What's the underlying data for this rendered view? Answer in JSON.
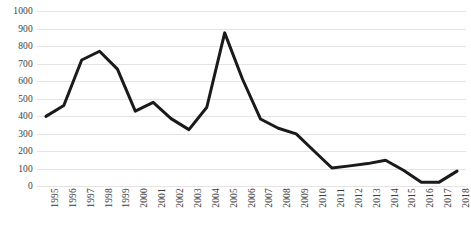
{
  "chart_data": {
    "type": "line",
    "title": "",
    "subtitle": "",
    "xlabel": "",
    "ylabel": "",
    "ylim": [
      0,
      1000
    ],
    "y_ticks": [
      0,
      100,
      200,
      300,
      400,
      500,
      600,
      700,
      800,
      900,
      1000
    ],
    "y_tick_labels": [
      "0",
      "100",
      "200",
      "300",
      "400",
      "500",
      "600",
      "700",
      "800",
      "900",
      "1000"
    ],
    "grid": "horizontal",
    "legend": "none",
    "line_color": "#1a1a1a",
    "line_width": 3,
    "markers": "none",
    "categories": [
      "1995",
      "1996",
      "1997",
      "1998",
      "1999",
      "2000",
      "2001",
      "2002",
      "2003",
      "2004",
      "2005",
      "2006",
      "2007",
      "2008",
      "2009",
      "2010",
      "2011",
      "2012",
      "2013",
      "2014",
      "2015",
      "2016",
      "2017",
      "2018"
    ],
    "x_tick_rotation": -90,
    "values": [
      398,
      460,
      720,
      770,
      668,
      428,
      478,
      385,
      322,
      450,
      875,
      610,
      383,
      330,
      298,
      200,
      103,
      115,
      128,
      147,
      90,
      22,
      22,
      85
    ],
    "series": [
      {
        "name": "series-1",
        "values": [
          398,
          460,
          720,
          770,
          668,
          428,
          478,
          385,
          322,
          450,
          875,
          610,
          383,
          330,
          298,
          200,
          103,
          115,
          128,
          147,
          90,
          22,
          22,
          85
        ]
      }
    ]
  },
  "colors": {
    "line": "#1a1a1a",
    "gridline": "#e6e4e2",
    "tick_text": "#3d3d3d",
    "background": "#ffffff"
  }
}
